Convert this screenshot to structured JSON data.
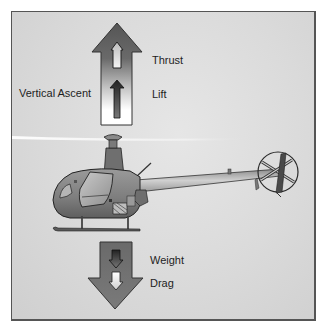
{
  "diagram": {
    "type": "force-diagram",
    "maneuver_label": "Vertical Ascent",
    "upward_forces": [
      {
        "label": "Thrust",
        "arrow_style": "outline-light"
      },
      {
        "label": "Lift",
        "arrow_style": "solid-dark"
      }
    ],
    "downward_forces": [
      {
        "label": "Weight",
        "arrow_style": "solid-dark"
      },
      {
        "label": "Drag",
        "arrow_style": "outline-light"
      }
    ],
    "colors": {
      "background": "#dadada",
      "frame_border": "#555555",
      "arrow_dark": "#5a5a5a",
      "arrow_light": "#ffffff",
      "fuselage": "#8a8a8a",
      "text": "#1e1e1e"
    }
  }
}
